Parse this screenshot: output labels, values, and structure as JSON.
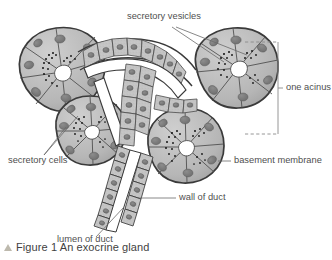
{
  "figure": {
    "caption_marker": "triangle-up-icon",
    "caption_text": "Figure 1 An exocrine gland",
    "title": "An exocrine gland"
  },
  "labels": {
    "secretory_vesicles": "secretory vesicles",
    "one_acinus": "one acinus",
    "secretory_cells": "secretory cells",
    "basement_membrane": "basement membrane",
    "wall_of_duct": "wall of duct",
    "lumen_of_duct": "lumen of duct"
  },
  "colors": {
    "cell_fill": "#b9b9b9",
    "cell_fill_light": "#c8c8c8",
    "nucleus": "#7b7b7b",
    "outline": "#2f2f2f",
    "membrane": "#555555",
    "vesicle": "#141414",
    "lumen": "#ffffff",
    "text": "#4f4f4f",
    "leader": "#6a6a6a",
    "bracket": "#8a8a8a",
    "caption_marker": "#bdb9ad",
    "background": "#ffffff"
  },
  "structures": {
    "acini_count": 4,
    "acinus_names": [
      "upper-left-acinus",
      "upper-right-acinus",
      "lower-left-acinus",
      "lower-right-acinus"
    ],
    "duct_name": "duct",
    "duct_cell_type": "cuboidal epithelium",
    "bracketed_acinus": "upper-right-acinus"
  }
}
